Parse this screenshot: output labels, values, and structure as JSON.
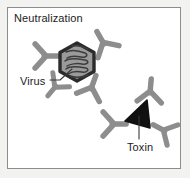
{
  "figure": {
    "title": "Neutralization",
    "background_color": "#f2f2f0",
    "panel_color": "#ffffff",
    "border_color": "#8d8d8d",
    "width": 190,
    "height": 178
  },
  "labels": {
    "title": "Neutralization",
    "virus": "Virus",
    "toxin": "Toxin"
  },
  "colors": {
    "antibody": "#8d8d8d",
    "antibody_dark": "#767676",
    "virus_outline": "#2b2b2b",
    "virus_fill": "#9a9a9a",
    "virus_nucleic_acid": "#3a3a3a",
    "toxin_fill": "#111111",
    "leader_line": "#3a3a3a",
    "text": "#1c1c1c"
  },
  "elements": {
    "virus": {
      "name": "Virus",
      "shape": "hexagon",
      "fill": "#9a9a9a",
      "outline": "#2b2b2b",
      "center_x": 77,
      "center_y": 62,
      "radius": 19,
      "antibody_count": 4
    },
    "toxin": {
      "name": "Toxin",
      "shape": "triangle",
      "fill": "#111111",
      "center_x": 139,
      "center_y": 117,
      "antibody_count": 3
    }
  },
  "antibodies": [
    {
      "id": "ab-virus-left",
      "cx": 44,
      "cy": 56,
      "rotation": -90
    },
    {
      "id": "ab-virus-top-right",
      "cx": 103,
      "cy": 44,
      "rotation": 150
    },
    {
      "id": "ab-virus-bottom",
      "cx": 90,
      "cy": 88,
      "rotation": 200
    },
    {
      "id": "ab-virus-bottom-left",
      "cx": 52,
      "cy": 80,
      "rotation": 35
    },
    {
      "id": "ab-toxin-left",
      "cx": 112,
      "cy": 124,
      "rotation": -90
    },
    {
      "id": "ab-toxin-top-right",
      "cx": 149,
      "cy": 93,
      "rotation": 185
    },
    {
      "id": "ab-toxin-right",
      "cx": 163,
      "cy": 130,
      "rotation": 120
    }
  ],
  "leaders": [
    {
      "id": "virus-leader",
      "from_x": 52,
      "from_y": 81,
      "to_x": 71,
      "to_y": 69
    },
    {
      "id": "toxin-leader",
      "from_x": 139,
      "from_y": 138,
      "to_x": 139,
      "to_y": 116
    }
  ]
}
